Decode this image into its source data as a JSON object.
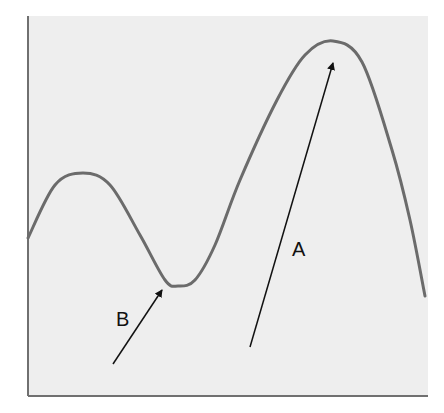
{
  "diagram": {
    "colors": {
      "background": "#ffffff",
      "panel": "#eeeeee",
      "axis": "#707070",
      "curve": "#6b6b6b",
      "arrow": "#111111"
    },
    "panel": {
      "x": 28,
      "y": 16,
      "width": 400,
      "height": 380
    },
    "curve_points": [
      [
        28,
        238
      ],
      [
        55,
        185
      ],
      [
        83,
        173
      ],
      [
        110,
        185
      ],
      [
        140,
        235
      ],
      [
        165,
        280
      ],
      [
        178,
        286
      ],
      [
        195,
        280
      ],
      [
        215,
        245
      ],
      [
        240,
        180
      ],
      [
        277,
        100
      ],
      [
        305,
        55
      ],
      [
        333,
        41
      ],
      [
        362,
        62
      ],
      [
        392,
        150
      ],
      [
        410,
        220
      ],
      [
        425,
        296
      ]
    ],
    "arrows": [
      {
        "id": "A",
        "label": "A",
        "from": [
          250,
          347
        ],
        "to": [
          333,
          63
        ],
        "label_pos": [
          292,
          256
        ]
      },
      {
        "id": "B",
        "label": "B",
        "from": [
          113,
          364
        ],
        "to": [
          162,
          290
        ],
        "label_pos": [
          116,
          326
        ]
      }
    ]
  }
}
